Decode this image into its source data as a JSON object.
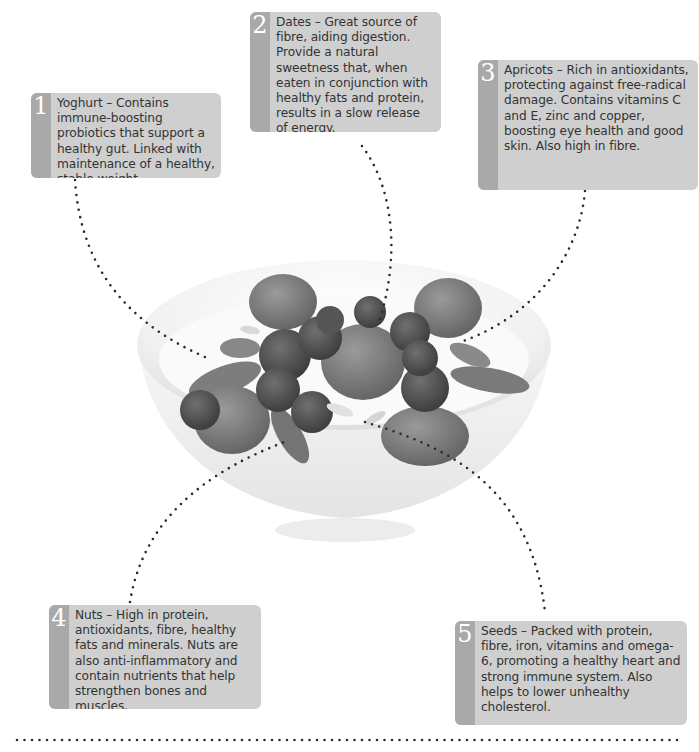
{
  "diagram": {
    "accent_colors": {
      "box_background": "#cfcfcf",
      "number_strip": "#a9a9a9",
      "number_text": "#ffffff",
      "body_text": "#333333",
      "dots": "#2b2b2b"
    },
    "callouts": [
      {
        "number": "1",
        "text": "Yoghurt – Contains immune-boosting probiotics that support a healthy gut. Linked with maintenance of a healthy, stable weight"
      },
      {
        "number": "2",
        "text": "Dates – Great source of fibre, aiding digestion. Provide a natural sweetness that, when eaten in conjunction with healthy fats and protein, results in a slow release of energy."
      },
      {
        "number": "3",
        "text": "Apricots – Rich in antioxidants, protecting against free-radical damage. Contains vitamins C and E, zinc and copper, boosting eye health and good skin. Also high in fibre."
      },
      {
        "number": "4",
        "text": "Nuts – High in protein, antioxidants, fibre, healthy fats and minerals. Nuts are also anti-inflammatory and contain nutrients that help strengthen bones and muscles."
      },
      {
        "number": "5",
        "text": "Seeds – Packed with protein, fibre, iron, vitamins and omega-6, promoting a healthy heart and strong immune system. Also helps to lower unhealthy cholesterol."
      }
    ]
  }
}
